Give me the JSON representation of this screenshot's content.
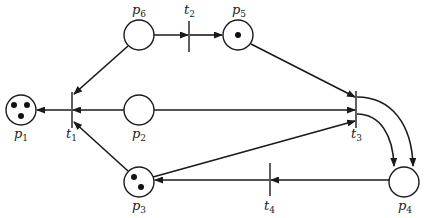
{
  "diagram": {
    "type": "petri-net",
    "places": [
      {
        "id": "p1",
        "label": "p",
        "sub": "1",
        "tokens": 3
      },
      {
        "id": "p2",
        "label": "p",
        "sub": "2",
        "tokens": 0
      },
      {
        "id": "p3",
        "label": "p",
        "sub": "3",
        "tokens": 2
      },
      {
        "id": "p4",
        "label": "p",
        "sub": "4",
        "tokens": 0
      },
      {
        "id": "p5",
        "label": "p",
        "sub": "5",
        "tokens": 1
      },
      {
        "id": "p6",
        "label": "p",
        "sub": "6",
        "tokens": 0
      }
    ],
    "transitions": [
      {
        "id": "t1",
        "label": "t",
        "sub": "1"
      },
      {
        "id": "t2",
        "label": "t",
        "sub": "2"
      },
      {
        "id": "t3",
        "label": "t",
        "sub": "3"
      },
      {
        "id": "t4",
        "label": "t",
        "sub": "4"
      }
    ],
    "arcs": [
      {
        "from": "p6",
        "to": "t2"
      },
      {
        "from": "t2",
        "to": "p5"
      },
      {
        "from": "p6",
        "to": "t1"
      },
      {
        "from": "p2",
        "to": "t1"
      },
      {
        "from": "p3",
        "to": "t1"
      },
      {
        "from": "t1",
        "to": "p1"
      },
      {
        "from": "p5",
        "to": "t3"
      },
      {
        "from": "p2",
        "to": "t3"
      },
      {
        "from": "p3",
        "to": "t3"
      },
      {
        "from": "t3",
        "to": "p4",
        "multiplicity": 2
      },
      {
        "from": "p4",
        "to": "t4"
      },
      {
        "from": "t4",
        "to": "p3"
      }
    ]
  }
}
